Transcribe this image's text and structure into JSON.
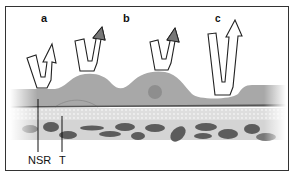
{
  "diagram": {
    "panel_labels": [
      "a",
      "b",
      "c"
    ],
    "layer_labels": {
      "nsr": "NSR",
      "t": "T"
    },
    "arrows": [
      {
        "id": "a1",
        "panel": "a",
        "head_fill": "#ffffff"
      },
      {
        "id": "a2",
        "panel": "a",
        "head_fill": "#777777"
      },
      {
        "id": "b1",
        "panel": "b",
        "head_fill": "#777777"
      },
      {
        "id": "c1",
        "panel": "c",
        "head_fill": "#ffffff"
      }
    ],
    "colors": {
      "upper_layer": "#a9a9a9",
      "stroma_band": "#d8d8d8",
      "cell_nuclei": "#5a5a5a",
      "outline": "#222222"
    }
  }
}
